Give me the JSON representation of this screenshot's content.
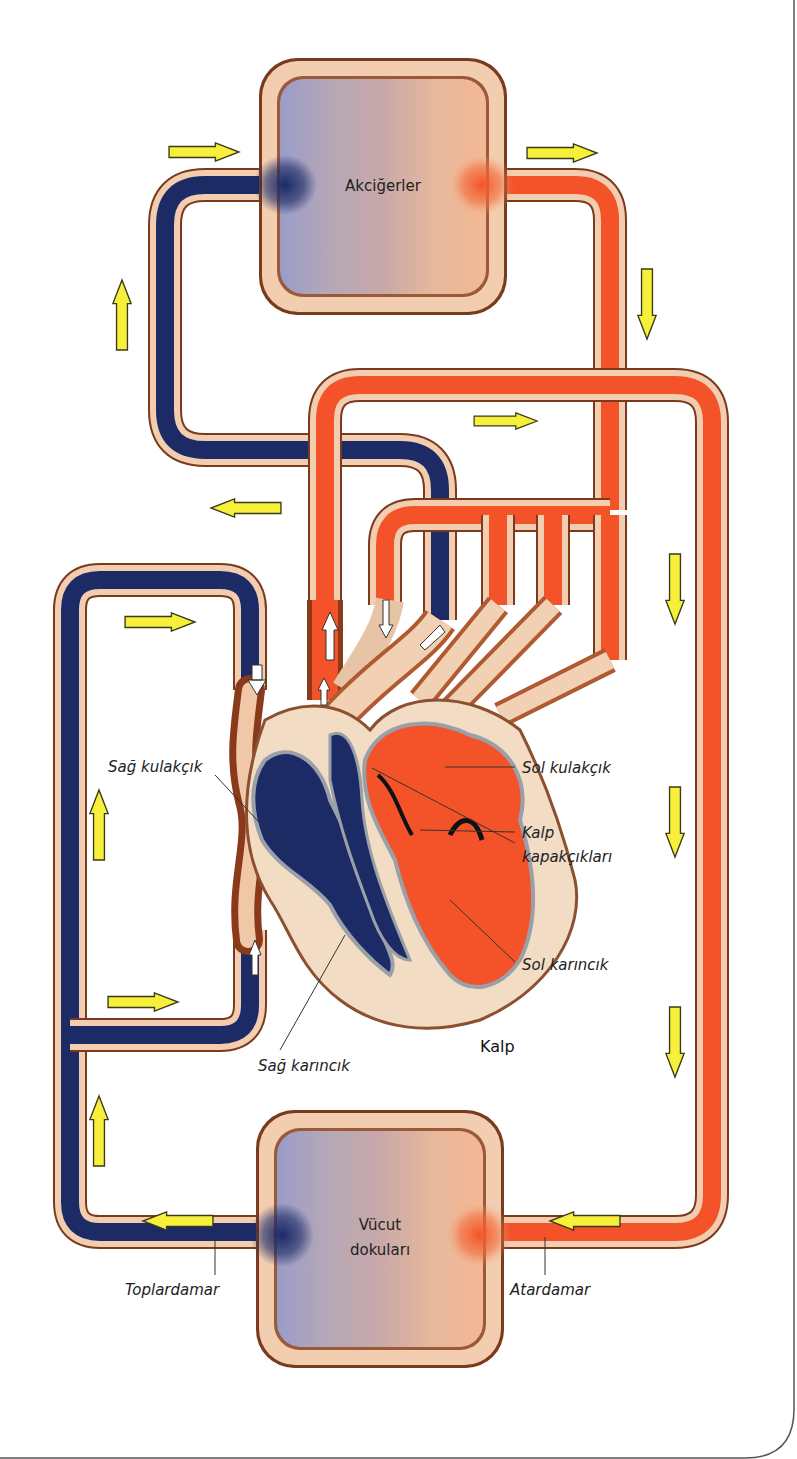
{
  "diagram": {
    "title": "Kalp",
    "organs": {
      "lungs": "Akciğerler",
      "body_tissues_line1": "Vücut",
      "body_tissues_line2": "dokuları"
    },
    "labels": {
      "right_atrium": "Sağ kulakçık",
      "left_atrium": "Sol kulakçık",
      "valves_line1": "Kalp",
      "valves_line2": "kapakçıkları",
      "left_ventricle": "Sol karıncık",
      "right_ventricle": "Sağ karıncık",
      "vein": "Toplardamar",
      "artery": "Atardamar"
    },
    "colors": {
      "deoxygenated": "#1c2a66",
      "oxygenated": "#f4532a",
      "vessel_wall": "#f2cdb0",
      "vessel_outline": "#7a3a1e",
      "flow_arrow": "#f6f03a",
      "organ_blue": "#9c9cc6",
      "organ_orange": "#f0b08c"
    },
    "flow_arrows": [
      {
        "id": "top-left",
        "direction": "right"
      },
      {
        "id": "top-right",
        "direction": "right"
      },
      {
        "id": "left-upper",
        "direction": "up"
      },
      {
        "id": "right-upper",
        "direction": "down"
      },
      {
        "id": "middle-right",
        "direction": "right"
      },
      {
        "id": "middle-left",
        "direction": "left"
      },
      {
        "id": "inner-left-top",
        "direction": "right"
      },
      {
        "id": "inner-left-mid",
        "direction": "up"
      },
      {
        "id": "inner-left-bottom",
        "direction": "right"
      },
      {
        "id": "outer-left-bottom",
        "direction": "up"
      },
      {
        "id": "right-1",
        "direction": "down"
      },
      {
        "id": "right-2",
        "direction": "down"
      },
      {
        "id": "right-3",
        "direction": "down"
      },
      {
        "id": "bottom-left",
        "direction": "left"
      },
      {
        "id": "bottom-right",
        "direction": "left"
      }
    ]
  }
}
